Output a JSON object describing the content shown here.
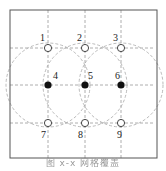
{
  "diagram": {
    "frame": {
      "x": 10,
      "y": 10,
      "width": 147,
      "height": 148,
      "stroke": "#555555"
    },
    "grid": {
      "vertical_x": [
        48,
        85,
        121
      ],
      "horizontal_y": [
        48,
        85,
        123
      ],
      "stroke": "#9a9a9a",
      "dash": "3,2"
    },
    "circles": [
      {
        "cx": 48,
        "cy": 85,
        "r": 42
      },
      {
        "cx": 85,
        "cy": 85,
        "r": 42
      },
      {
        "cx": 121,
        "cy": 85,
        "r": 42
      }
    ],
    "nodes": [
      {
        "id": "1",
        "label": "1",
        "x": 48,
        "y": 48,
        "filled": false,
        "label_dx": -8,
        "label_dy": -7
      },
      {
        "id": "2",
        "label": "2",
        "x": 85,
        "y": 48,
        "filled": false,
        "label_dx": -8,
        "label_dy": -7
      },
      {
        "id": "3",
        "label": "3",
        "x": 121,
        "y": 48,
        "filled": false,
        "label_dx": -8,
        "label_dy": -7
      },
      {
        "id": "4",
        "label": "4",
        "x": 48,
        "y": 85,
        "filled": true,
        "label_dx": 5,
        "label_dy": -6
      },
      {
        "id": "5",
        "label": "5",
        "x": 85,
        "y": 85,
        "filled": true,
        "label_dx": 3,
        "label_dy": -6
      },
      {
        "id": "6",
        "label": "6",
        "x": 121,
        "y": 85,
        "filled": true,
        "label_dx": -6,
        "label_dy": -6
      },
      {
        "id": "7",
        "label": "7",
        "x": 48,
        "y": 123,
        "filled": false,
        "label_dx": -7,
        "label_dy": 15
      },
      {
        "id": "8",
        "label": "8",
        "x": 85,
        "y": 123,
        "filled": false,
        "label_dx": -7,
        "label_dy": 15
      },
      {
        "id": "9",
        "label": "9",
        "x": 121,
        "y": 123,
        "filled": false,
        "label_dx": -4,
        "label_dy": 15
      }
    ],
    "caption": "图 x-x 网格覆盖"
  }
}
